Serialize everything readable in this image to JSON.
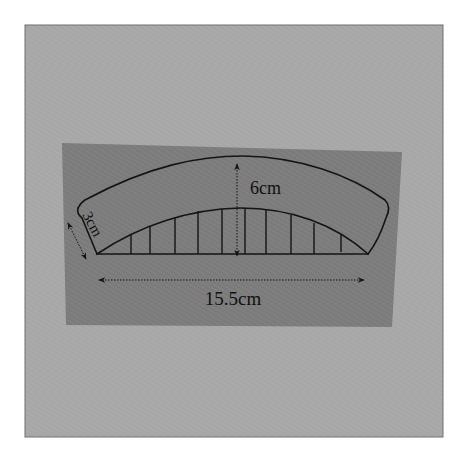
{
  "figure": {
    "type": "sewing-pattern-diagram",
    "colors": {
      "background": "#ffffff",
      "mat": "#a7a7a7",
      "mat_border": "#6f6f6f",
      "paper": "#7b7b7b",
      "ink": "#141414"
    },
    "dimensions": {
      "height_label": "6cm",
      "width_label": "15.5cm",
      "band_label": "3cm"
    },
    "hatch_line_count": 10
  }
}
